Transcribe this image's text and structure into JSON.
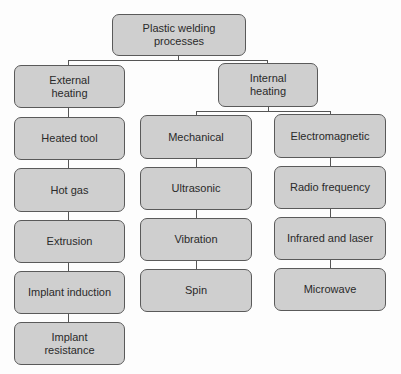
{
  "diagram": {
    "title": "Plastic welding processes",
    "root": {
      "label": "Plastic welding\nprocesses"
    },
    "external": {
      "label": "External\nheating",
      "children": [
        "Heated tool",
        "Hot gas",
        "Extrusion",
        "Implant induction",
        "Implant\nresistance"
      ]
    },
    "internal": {
      "label": "Internal\nheating",
      "mechanical": {
        "label": "Mechanical",
        "children": [
          "Ultrasonic",
          "Vibration",
          "Spin"
        ]
      },
      "electromagnetic": {
        "label": "Electromagnetic",
        "children": [
          "Radio frequency",
          "Infrared and laser",
          "Microwave"
        ]
      }
    }
  },
  "colors": {
    "box_fill": "#cfcfcf",
    "box_border": "#5a5a5a",
    "line": "#555555",
    "text": "#2a2a2a"
  }
}
